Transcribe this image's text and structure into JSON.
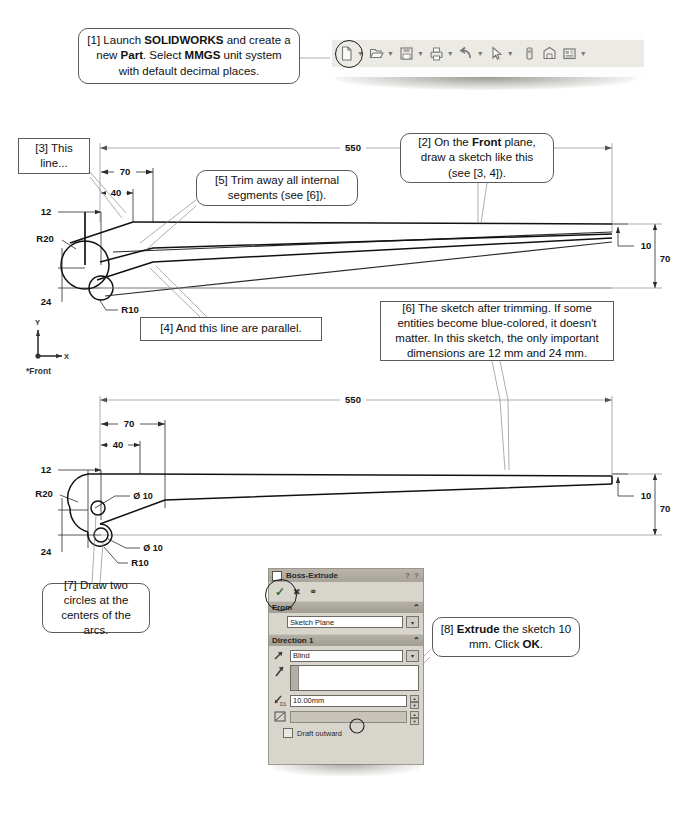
{
  "document": {
    "type": "solidworks-tutorial-figure",
    "front_plane_label": "*Front"
  },
  "steps": {
    "s1": {
      "id": "[1]",
      "text_parts": [
        "[1] Launch ",
        "SOLIDWORKS",
        " and create a new ",
        "Part",
        ". Select ",
        "MMGS",
        " unit system with default decimal places."
      ],
      "plain": "[1] Launch SOLIDWORKS and create a new Part. Select MMGS unit system with default decimal places."
    },
    "s2": {
      "id": "[2]",
      "plain": "[2] On the Front plane, draw a sketch like this (see [3, 4])."
    },
    "s3": {
      "id": "[3]",
      "plain": "[3] This line..."
    },
    "s4": {
      "id": "[4]",
      "plain": "[4] And this line are parallel."
    },
    "s5": {
      "id": "[5]",
      "plain": "[5] Trim away all internal segments (see [6])."
    },
    "s6": {
      "id": "[6]",
      "plain": "[6] The sketch after trimming.  If some entities become blue-colored, it doesn't matter.  In this sketch, the only important dimensions are 12 mm and 24 mm."
    },
    "s7": {
      "id": "[7]",
      "plain": "[7] Draw two circles at the centers of the arcs."
    },
    "s8": {
      "id": "[8]",
      "plain": "[8] Extrude the sketch 10 mm.  Click OK."
    }
  },
  "toolbar": {
    "icons": [
      {
        "name": "new-document-icon",
        "caret": true,
        "highlighted": true
      },
      {
        "name": "open-folder-icon",
        "caret": true,
        "highlighted": false
      },
      {
        "name": "save-icon",
        "caret": true,
        "highlighted": false
      },
      {
        "name": "print-icon",
        "caret": true,
        "highlighted": false
      },
      {
        "name": "undo-icon",
        "caret": true,
        "highlighted": false
      },
      {
        "name": "select-cursor-icon",
        "caret": true,
        "highlighted": false
      },
      {
        "name": "rebuild-icon",
        "caret": false,
        "highlighted": false
      },
      {
        "name": "options-toggle-icon",
        "caret": false,
        "highlighted": false
      },
      {
        "name": "display-manager-icon",
        "caret": true,
        "highlighted": false
      }
    ]
  },
  "drawing_top": {
    "caption": "untrimmed sketch",
    "dimensions": [
      {
        "label": "550",
        "kind": "overall-length"
      },
      {
        "label": "70",
        "kind": "horizontal"
      },
      {
        "label": "40",
        "kind": "horizontal"
      },
      {
        "label": "12",
        "kind": "vertical"
      },
      {
        "label": "24",
        "kind": "vertical"
      },
      {
        "label": "R20",
        "kind": "radius"
      },
      {
        "label": "R10",
        "kind": "radius"
      },
      {
        "label": "10",
        "kind": "vertical-right"
      },
      {
        "label": "70",
        "kind": "vertical-right-overall"
      }
    ]
  },
  "drawing_bottom": {
    "caption": "trimmed sketch with circles",
    "dimensions": [
      {
        "label": "550",
        "kind": "overall-length"
      },
      {
        "label": "70",
        "kind": "horizontal"
      },
      {
        "label": "40",
        "kind": "horizontal"
      },
      {
        "label": "12",
        "kind": "vertical"
      },
      {
        "label": "24",
        "kind": "vertical"
      },
      {
        "label": "R20",
        "kind": "radius"
      },
      {
        "label": "R10",
        "kind": "radius"
      },
      {
        "label": "Ø 10",
        "kind": "diameter-upper"
      },
      {
        "label": "Ø 10",
        "kind": "diameter-lower"
      },
      {
        "label": "10",
        "kind": "vertical-right"
      },
      {
        "label": "70",
        "kind": "vertical-right-overall"
      }
    ]
  },
  "property_manager": {
    "title": "Boss-Extrude",
    "help_glyphs": "? ?",
    "actions": [
      {
        "name": "accept-ok-button",
        "glyph": "✓",
        "highlighted": true
      },
      {
        "name": "cancel-button",
        "glyph": "✖",
        "highlighted": false
      },
      {
        "name": "detailed-preview-button",
        "glyph": "⚭",
        "highlighted": false
      }
    ],
    "from_section": {
      "header": "From",
      "collapse_glyph": "⌃",
      "value": "Sketch Plane",
      "dropdown_glyph": "▾"
    },
    "direction1_section": {
      "header": "Direction 1",
      "collapse_glyph": "⌃",
      "end_condition": "Blind",
      "dropdown_glyph": "▾",
      "depth_label": "D1",
      "depth_value": "10.00mm",
      "draft_checkbox_label": "Draft outward",
      "draft_checked": false
    }
  },
  "axes": {
    "y_label": "Y",
    "x_label": "X"
  }
}
